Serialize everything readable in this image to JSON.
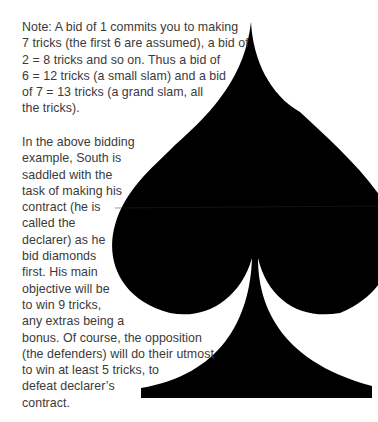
{
  "page": {
    "background": "#ffffff",
    "text_color": "#3a3a3a",
    "graphic": {
      "icon": "spade-suit-icon",
      "color": "#000000"
    }
  },
  "note": {
    "lines": [
      "Note: A bid of 1 commits you to making",
      "7 tricks (the first 6 are assumed), a bid of",
      "2 = 8 tricks and so on. Thus a bid of",
      "6 = 12 tricks (a small slam) and a bid",
      "of 7 = 13 tricks (a grand slam, all",
      "the tricks)."
    ]
  },
  "bidding": {
    "lines": [
      "In the above bidding",
      "example, South is",
      "saddled with the",
      "task of making his",
      "contract (he is",
      "called the",
      "declarer) as he",
      "bid diamonds",
      "first. His main",
      "objective will be",
      "to win 9 tricks,",
      "any extras being a",
      "bonus. Of course, the opposition",
      "(the defenders) will do their utmost",
      "to win at least 5 tricks, to",
      "defeat declarer’s",
      "contract."
    ]
  }
}
